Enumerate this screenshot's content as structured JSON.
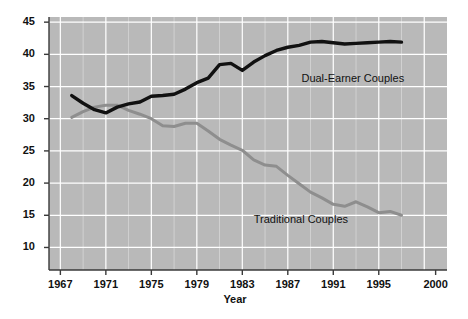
{
  "chart_data": {
    "type": "line",
    "title": "",
    "xlabel": "Year",
    "ylabel": "",
    "xlim": [
      1966,
      2001
    ],
    "ylim": [
      6.5,
      45.8
    ],
    "grid": true,
    "grid_color": "#ffffff",
    "plot_background": "#b9b9b9",
    "legend_position": "inline-annotations",
    "xticks": [
      "1967",
      "1971",
      "1975",
      "1979",
      "1983",
      "1987",
      "1991",
      "1995",
      "2000"
    ],
    "xtick_values": [
      1967,
      1971,
      1975,
      1979,
      1983,
      1987,
      1991,
      1995,
      2000
    ],
    "yticks": [
      "45",
      "40",
      "35",
      "30",
      "25",
      "20",
      "15",
      "10"
    ],
    "ytick_values": [
      45,
      40,
      35,
      30,
      25,
      20,
      15,
      10
    ],
    "series": [
      {
        "name": "Dual-Earner Couples",
        "color": "#111111",
        "label_x": 1988.2,
        "label_y": 36.2,
        "x": [
          1968,
          1969,
          1970,
          1971,
          1972,
          1973,
          1974,
          1975,
          1976,
          1977,
          1978,
          1979,
          1980,
          1981,
          1982,
          1983,
          1984,
          1985,
          1986,
          1987,
          1988,
          1989,
          1990,
          1991,
          1992,
          1993,
          1994,
          1995,
          1996,
          1997
        ],
        "values": [
          33.6,
          32.4,
          31.4,
          30.9,
          31.8,
          32.3,
          32.6,
          33.5,
          33.6,
          33.8,
          34.6,
          35.6,
          36.3,
          38.4,
          38.6,
          37.5,
          38.8,
          39.8,
          40.6,
          41.1,
          41.4,
          41.9,
          42.0,
          41.8,
          41.6,
          41.7,
          41.8,
          41.9,
          42.0,
          41.9
        ]
      },
      {
        "name": "Traditional Couples",
        "color": "#8e8e8e",
        "label_x": 1984.0,
        "label_y": 14.2,
        "x": [
          1968,
          1969,
          1970,
          1971,
          1972,
          1973,
          1974,
          1975,
          1976,
          1977,
          1978,
          1979,
          1980,
          1981,
          1982,
          1983,
          1984,
          1985,
          1986,
          1987,
          1988,
          1989,
          1990,
          1991,
          1992,
          1993,
          1994,
          1995,
          1996,
          1997
        ],
        "values": [
          30.2,
          31.1,
          31.8,
          32.1,
          32.1,
          31.3,
          30.7,
          30.0,
          28.9,
          28.8,
          29.3,
          29.3,
          28.1,
          26.8,
          25.9,
          25.1,
          23.6,
          22.8,
          22.6,
          21.2,
          19.9,
          18.6,
          17.7,
          16.7,
          16.4,
          17.1,
          16.3,
          15.4,
          15.6,
          15.0
        ]
      }
    ]
  },
  "labels": {
    "dual_earner": "Dual-Earner Couples",
    "traditional": "Traditional Couples",
    "x_axis_title": "Year"
  }
}
